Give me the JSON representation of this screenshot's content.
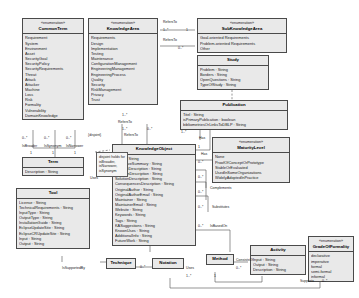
{
  "diagram": {
    "type": "uml-class-diagram"
  },
  "classes": {
    "commonTerm": {
      "stereotype": "«enumeration»",
      "name": "CommonTerm",
      "literals": [
        "Requirement",
        "System",
        "Environment",
        "Asset",
        "SecurityGoal",
        "SecurityPolicy",
        "SecurityRequirements",
        "Threat",
        "Attack",
        "Attacker",
        "Machine",
        "Loss",
        "Risk",
        "Formality",
        "Vulnerability",
        "DomainKnowledge"
      ]
    },
    "knowledgeArea": {
      "stereotype": "«enumeration»",
      "name": "KnowledgeArea",
      "literals": [
        "Requirements",
        "Design",
        "Implementation",
        "Testing",
        "Maintenance",
        "ConfigurationManagement",
        "EngineeringManagement",
        "EngineeringProcess",
        "Quality",
        "Security",
        "RiskManagement",
        "Privacy",
        "Trust"
      ]
    },
    "subKnowledgeArea": {
      "stereotype": "«enumeration»",
      "name": "SubKnowledgeArea",
      "literals": [
        "Goal-oriented Requirements",
        "Problem-oriented Requirements",
        "Other"
      ]
    },
    "study": {
      "stereotype": "",
      "name": "Study",
      "attributes": [
        "Problem : String",
        "Borders : String",
        "OpenQuestions : String",
        "TypeOfStudy : String"
      ]
    },
    "publication": {
      "stereotype": "",
      "name": "Publication",
      "attributes": [
        "Titel : String",
        "isPrimaryPublication : boolean",
        "bibliometriesOrLinksToDBLP : String"
      ]
    },
    "maturityLevel": {
      "stereotype": "«enumeration»",
      "name": "MaturityLevel",
      "literals": [
        "None",
        "ProofOfConceptOrPrototype",
        "StableOrEvaluated",
        "UsedInSomeOrganizations",
        "WidelyAdoptedInPractice"
      ]
    },
    "knowledgeObject": {
      "stereotype": "",
      "name": "KnowledgeObject",
      "attributes": [
        "Name : String",
        "ExecutiveSummary : String",
        "ContextDescription : String",
        "ProblemDescription : String",
        "SolutionDescription : String",
        "ConsequencesDescription : String",
        "OriginalAuthor : String",
        "OriginalAuthorEmail : String",
        "Maintainer : String",
        "MaintainerEmail : String",
        "Website : String",
        "Keywords : String",
        "Tags : String",
        "KASuggestions : String",
        "KnownUses : String",
        "AdditionalInfo : String",
        "FutureWork : String"
      ]
    },
    "term": {
      "stereotype": "",
      "name": "Term",
      "attributes": [
        "Description : String"
      ]
    },
    "tool": {
      "stereotype": "",
      "name": "Tool",
      "attributes": [
        "License : String",
        "TechnicalRequirements : String",
        "InputType : String",
        "OutputType : String",
        "InstallationGuide : String",
        "EclipseUpdateSite : String",
        "EclipseCRUpdateSite : String",
        "Input : String",
        "Output : String"
      ]
    },
    "technique": {
      "stereotype": "",
      "name": "Technique",
      "attributes": []
    },
    "notation": {
      "stereotype": "",
      "name": "Notation",
      "attributes": []
    },
    "method": {
      "stereotype": "",
      "name": "Method",
      "attributes": []
    },
    "activity": {
      "stereotype": "",
      "name": "Activity",
      "attributes": [
        "Input : String",
        "Output : String",
        "Description : String"
      ]
    },
    "gradeOfFormality": {
      "stereotype": "«enumeration»",
      "name": "GradeOfFormality",
      "literals": [
        "declarative",
        "imperative",
        "formal",
        "semi-formal",
        "informal"
      ]
    }
  },
  "notes": {
    "synonymNote": "disjoint holds for isBroader, isNarrower, isSynonym"
  },
  "edge_labels": {
    "refersTo1": "RefersTo",
    "refersTo2": "RefersTo",
    "refersTo3": "RefersTo",
    "refersTo4": "RefersTo",
    "has1": "Has",
    "has2": "Has",
    "complements": "Complements",
    "substitutes": "Substitutes",
    "isBasedOn": "IsBasedOn",
    "uses1": "Uses",
    "uses2": "Uses",
    "isSupportedBy": "IsSupportedBy",
    "consistsOf": "ConsistsOf",
    "supports": "Supports",
    "disjoint": "{disjoint}",
    "isBroader": "IsBroader",
    "isSynonym": "IsSynonym",
    "isNarrower": "IsNarrower"
  },
  "multiplicities": {
    "m_0n_a": "0..*",
    "m_0n_b": "0..*",
    "m_0n_c": "0..*",
    "m_0n_d": "0..*",
    "m_0n_e": "0..*",
    "m_0n_f": "0..*",
    "m_0n_g": "0..*",
    "m_0n_h": "0..*",
    "m_0n_i": "0..*",
    "m_0n_j": "0..*",
    "m_0n_k": "0..*",
    "m_0n_l": "0..*",
    "m_1n_a": "1..*",
    "m_1n_b": "1..*",
    "m_1n_c": "1..*",
    "m_1n_d": "1..*",
    "m_1n_e": "1..*",
    "m_1_a": "1",
    "m_1_b": "1",
    "m_1_c": "1",
    "m_1_d": "1",
    "m_1_e": "1",
    "m_1_f": "1"
  }
}
